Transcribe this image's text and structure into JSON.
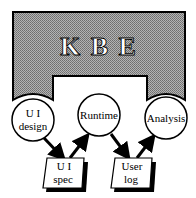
{
  "title": {
    "text": "K B E"
  },
  "processes": [
    {
      "id": "ui-design",
      "lines": [
        "U I",
        "design"
      ]
    },
    {
      "id": "runtime",
      "lines": [
        "Runtime"
      ]
    },
    {
      "id": "analysis",
      "lines": [
        "Analysis"
      ]
    }
  ],
  "documents": [
    {
      "id": "ui-spec",
      "lines": [
        "U I",
        "spec"
      ]
    },
    {
      "id": "user-log",
      "lines": [
        "User",
        "log"
      ]
    }
  ],
  "flows": [
    {
      "from": "ui-design",
      "to": "ui-spec"
    },
    {
      "from": "ui-spec",
      "to": "runtime"
    },
    {
      "from": "runtime",
      "to": "user-log"
    },
    {
      "from": "user-log",
      "to": "analysis"
    }
  ],
  "colors": {
    "kbe_fill": "#9a9a9a",
    "stroke": "#000000",
    "background": "#ffffff"
  }
}
